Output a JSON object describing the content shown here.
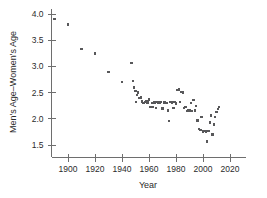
{
  "chart_data": {
    "type": "scatter",
    "title": "",
    "xlabel": "Year",
    "ylabel": "Men's Age–Women's Age",
    "xlim": [
      1885,
      2028
    ],
    "ylim": [
      1.45,
      4.05
    ],
    "xticks": [
      1900,
      1920,
      1940,
      1960,
      1980,
      2000,
      2020
    ],
    "yticks": [
      1.5,
      2.0,
      2.5,
      3.0,
      3.5,
      4.0
    ],
    "xticklabels": [
      "1900",
      "1920",
      "1940",
      "1960",
      "1980",
      "2000",
      "2020"
    ],
    "yticklabels": [
      "1.5",
      "2.0",
      "2.5",
      "3.0",
      "3.5",
      "4.0"
    ],
    "grid": false,
    "legend": null,
    "marker": {
      "shape": "square",
      "size_px": 2.4,
      "color": "#58585a"
    },
    "series": [
      {
        "name": "Men's Age minus Women's Age at first marriage",
        "points": [
          [
            1890,
            3.9
          ],
          [
            1900,
            3.8
          ],
          [
            1910,
            3.33
          ],
          [
            1920,
            3.25
          ],
          [
            1930,
            2.89
          ],
          [
            1940,
            2.7
          ],
          [
            1947,
            3.07
          ],
          [
            1948,
            2.72
          ],
          [
            1949,
            2.6
          ],
          [
            1950,
            2.53
          ],
          [
            1950.5,
            2.32
          ],
          [
            1951,
            2.45
          ],
          [
            1952,
            2.5
          ],
          [
            1953,
            2.4
          ],
          [
            1954,
            2.41
          ],
          [
            1955,
            2.33
          ],
          [
            1956,
            2.3
          ],
          [
            1957,
            2.32
          ],
          [
            1958,
            2.33
          ],
          [
            1959,
            2.31
          ],
          [
            1960,
            2.37
          ],
          [
            1961,
            2.22
          ],
          [
            1962,
            2.3
          ],
          [
            1963,
            2.22
          ],
          [
            1964,
            2.31
          ],
          [
            1965,
            2.21
          ],
          [
            1966,
            2.32
          ],
          [
            1967,
            2.31
          ],
          [
            1968,
            2.31
          ],
          [
            1969,
            2.32
          ],
          [
            1970,
            2.2
          ],
          [
            1971,
            2.31
          ],
          [
            1972,
            2.31
          ],
          [
            1973,
            2.3
          ],
          [
            1974,
            2.16
          ],
          [
            1975,
            1.96
          ],
          [
            1976,
            2.32
          ],
          [
            1977,
            2.31
          ],
          [
            1978,
            2.21
          ],
          [
            1979,
            2.32
          ],
          [
            1980,
            2.29
          ],
          [
            1981,
            2.55
          ],
          [
            1982,
            2.56
          ],
          [
            1983,
            2.32
          ],
          [
            1984,
            2.51
          ],
          [
            1985,
            2.5
          ],
          [
            1986,
            2.21
          ],
          [
            1987,
            2.22
          ],
          [
            1988,
            2.15
          ],
          [
            1989,
            2.16
          ],
          [
            1990,
            2.16
          ],
          [
            1991,
            2.3
          ],
          [
            1992,
            2.15
          ],
          [
            1993,
            2.36
          ],
          [
            1994,
            2.16
          ],
          [
            1995,
            2.24
          ],
          [
            1996,
            1.97
          ],
          [
            1997,
            1.8
          ],
          [
            1998,
            1.79
          ],
          [
            1999,
            2.03
          ],
          [
            2000,
            1.76
          ],
          [
            2001,
            1.77
          ],
          [
            2002,
            1.76
          ],
          [
            2003,
            1.57
          ],
          [
            2004,
            1.77
          ],
          [
            2005,
            1.93
          ],
          [
            2006,
            2.06
          ],
          [
            2007,
            1.7
          ],
          [
            2008,
            1.89
          ],
          [
            2009,
            2.04
          ],
          [
            2010,
            2.13
          ],
          [
            2011,
            2.19
          ],
          [
            2012,
            2.22
          ]
        ]
      }
    ]
  }
}
